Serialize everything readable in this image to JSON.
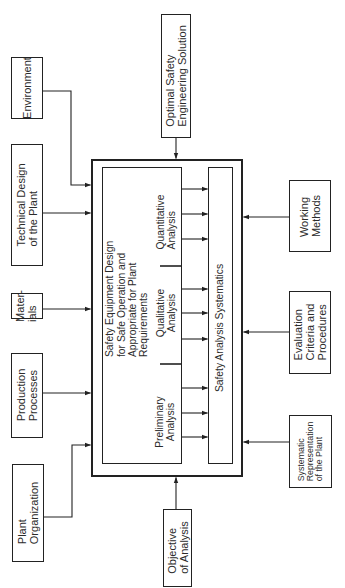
{
  "diagram": {
    "inputs_left": [
      {
        "id": "environment",
        "lines": [
          "Environment"
        ]
      },
      {
        "id": "technical-design",
        "lines": [
          "Technical Design",
          "of the Plant"
        ]
      },
      {
        "id": "materials",
        "lines": [
          "Mater-",
          "ials"
        ]
      },
      {
        "id": "production-processes",
        "lines": [
          "Production",
          "Processes"
        ]
      },
      {
        "id": "plant-organization",
        "lines": [
          "Plant",
          "Organization"
        ]
      }
    ],
    "output_top": {
      "id": "optimal-solution",
      "lines": [
        "Optimal Safety",
        "Engineering Solution"
      ]
    },
    "input_bottom": {
      "id": "objective",
      "lines": [
        "Objective",
        "of Analysis"
      ]
    },
    "inputs_right": [
      {
        "id": "working-methods",
        "lines": [
          "Working",
          "Methods"
        ]
      },
      {
        "id": "evaluation-criteria",
        "lines": [
          "Evaluation",
          "Criteria and",
          "Procedures"
        ]
      },
      {
        "id": "systematic-representation",
        "lines": [
          "Systematic",
          "Representation",
          "of the Plant"
        ]
      }
    ],
    "core": {
      "design_goal": [
        "Safety Equipment Design",
        "for Safe Operation and",
        "Appropriate for Plant",
        "Requirements"
      ],
      "analyses": [
        {
          "id": "quantitative",
          "lines": [
            "Quantitative",
            "Analysis"
          ]
        },
        {
          "id": "qualitative",
          "lines": [
            "Qualitative",
            "Analysis"
          ]
        },
        {
          "id": "preliminary",
          "lines": [
            "Preliminary",
            "Analysis"
          ]
        }
      ],
      "systematics": "Safety Analysis Systematics"
    },
    "colors": {
      "line": "#222222",
      "text": "#2b2b2b",
      "background": "#ffffff"
    }
  }
}
